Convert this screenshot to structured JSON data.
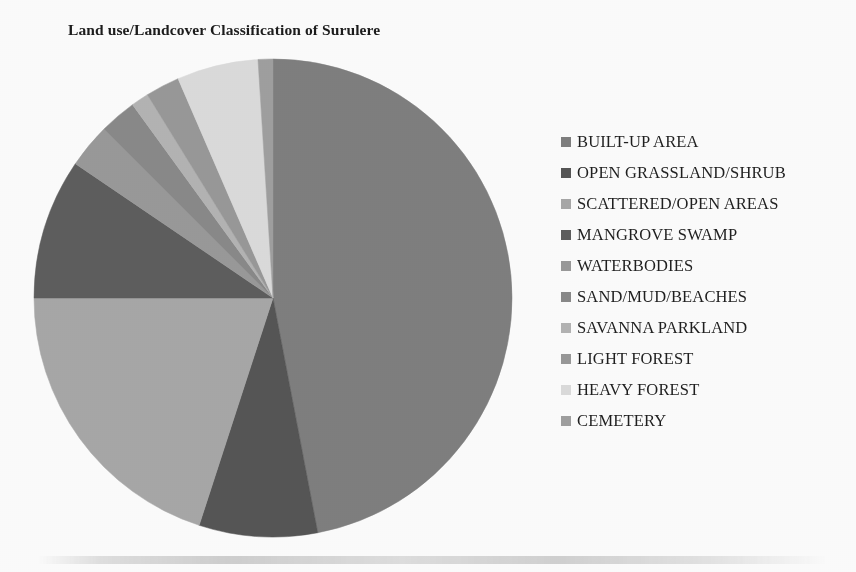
{
  "title": "Land use/Landcover Classification of Surulere",
  "legend": {
    "position": "right",
    "items": [
      {
        "label": "BUILT-UP AREA",
        "color": "#7f7f7f"
      },
      {
        "label": "OPEN GRASSLAND/SHRUB",
        "color": "#565656"
      },
      {
        "label": "SCATTERED/OPEN AREAS",
        "color": "#a8a8a8"
      },
      {
        "label": "MANGROVE SWAMP",
        "color": "#5e5e5e"
      },
      {
        "label": "WATERBODIES",
        "color": "#9a9a9a"
      },
      {
        "label": "SAND/MUD/BEACHES",
        "color": "#8a8a8a"
      },
      {
        "label": "SAVANNA PARKLAND",
        "color": "#b4b4b4"
      },
      {
        "label": "LIGHT FOREST",
        "color": "#999999"
      },
      {
        "label": "HEAVY FOREST",
        "color": "#dcdcdc"
      },
      {
        "label": "CEMETERY",
        "color": "#a0a0a0"
      }
    ]
  },
  "chart_data": {
    "type": "pie",
    "title": "Land use/Landcover Classification of Surulere",
    "xlabel": "",
    "ylabel": "",
    "legend_position": "right",
    "start_angle_deg": 0,
    "direction": "clockwise",
    "categories": [
      "BUILT-UP AREA",
      "OPEN GRASSLAND/SHRUB",
      "SCATTERED/OPEN AREAS",
      "MANGROVE SWAMP",
      "WATERBODIES",
      "SAND/MUD/BEACHES",
      "SAVANNA PARKLAND",
      "LIGHT FOREST",
      "HEAVY FOREST",
      "CEMETERY"
    ],
    "values": [
      47.0,
      8.0,
      20.0,
      9.5,
      3.0,
      2.5,
      1.2,
      2.3,
      5.5,
      1.0
    ],
    "unit": "percent",
    "slices": [
      {
        "label": "BUILT-UP AREA",
        "value": 47.0,
        "color": "#7f7f7f",
        "start_deg": 0.0,
        "end_deg": 169.2
      },
      {
        "label": "OPEN GRASSLAND/SHRUB",
        "value": 8.0,
        "color": "#565656",
        "start_deg": 169.2,
        "end_deg": 198.0
      },
      {
        "label": "SCATTERED/OPEN AREAS",
        "value": 20.0,
        "color": "#a8a8a8",
        "start_deg": 198.0,
        "end_deg": 270.0
      },
      {
        "label": "MANGROVE SWAMP",
        "value": 9.5,
        "color": "#5e5e5e",
        "start_deg": 270.0,
        "end_deg": 304.2
      },
      {
        "label": "WATERBODIES",
        "value": 3.0,
        "color": "#9a9a9a",
        "start_deg": 304.2,
        "end_deg": 315.0
      },
      {
        "label": "SAND/MUD/BEACHES",
        "value": 2.5,
        "color": "#8a8a8a",
        "start_deg": 315.0,
        "end_deg": 324.0
      },
      {
        "label": "SAVANNA PARKLAND",
        "value": 1.2,
        "color": "#b4b4b4",
        "start_deg": 324.0,
        "end_deg": 328.3
      },
      {
        "label": "LIGHT FOREST",
        "value": 2.3,
        "color": "#999999",
        "start_deg": 328.3,
        "end_deg": 336.6
      },
      {
        "label": "HEAVY FOREST",
        "value": 5.5,
        "color": "#dcdcdc",
        "start_deg": 336.6,
        "end_deg": 356.4
      },
      {
        "label": "CEMETERY",
        "value": 1.0,
        "color": "#a0a0a0",
        "start_deg": 356.4,
        "end_deg": 360.0
      }
    ],
    "geometry": {
      "center_x": 240,
      "center_y": 240,
      "radius": 239
    }
  }
}
